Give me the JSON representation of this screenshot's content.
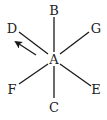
{
  "diagram": {
    "center": {
      "label": "A",
      "x": 54,
      "y": 59
    },
    "rays": [
      {
        "label": "B",
        "lx": 54,
        "ly": 15,
        "x1": 54,
        "y1": 52,
        "x2": 54,
        "y2": 17
      },
      {
        "label": "G",
        "lx": 96,
        "ly": 33,
        "x1": 60,
        "y1": 54,
        "x2": 89,
        "y2": 32
      },
      {
        "label": "D",
        "lx": 12,
        "ly": 33,
        "x1": 48,
        "y1": 54,
        "x2": 19,
        "y2": 32
      },
      {
        "label": "F",
        "lx": 12,
        "ly": 94,
        "x1": 48,
        "y1": 64,
        "x2": 19,
        "y2": 84
      },
      {
        "label": "C",
        "lx": 54,
        "ly": 112,
        "x1": 54,
        "y1": 66,
        "x2": 54,
        "y2": 98
      },
      {
        "label": "E",
        "lx": 96,
        "ly": 94,
        "x1": 60,
        "y1": 64,
        "x2": 91,
        "y2": 86
      }
    ],
    "arrow": {
      "x1": 36,
      "y1": 55,
      "x2": 16,
      "y2": 42,
      "direction": "toward D"
    },
    "colors": {
      "line": "#1a1a1a",
      "text": "#222222",
      "background": "#ffffff"
    }
  }
}
